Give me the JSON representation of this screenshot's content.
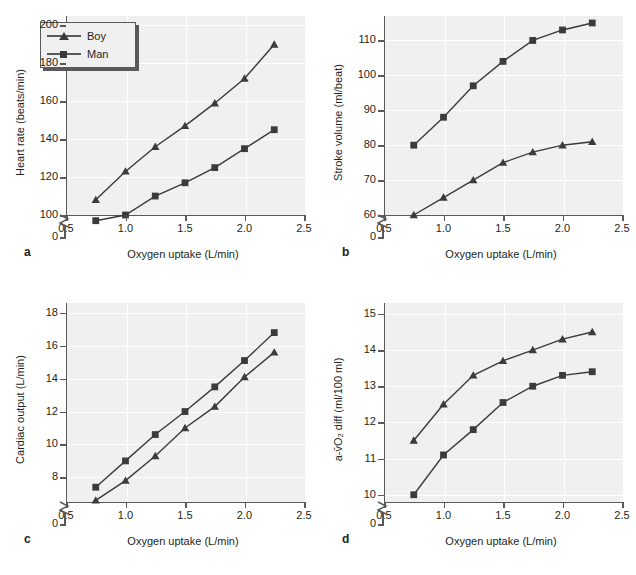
{
  "figure": {
    "legend": {
      "boy_label": "Boy",
      "man_label": "Man"
    },
    "xlabel": "Oxygen uptake (L/min)",
    "xticks": [
      "0.5",
      "1.0",
      "1.5",
      "2.0",
      "2.5"
    ],
    "panel_letters": {
      "a": "a",
      "b": "b",
      "c": "c",
      "d": "d"
    },
    "colors": {
      "plot_background": "#f0f0f0",
      "gridline": "#ffffff",
      "axis": "#58595b",
      "series": "#3b3b3d",
      "text": "#231f20"
    }
  },
  "chart_data": [
    {
      "type": "line",
      "panel": "a",
      "title": "",
      "xlabel": "Oxygen uptake (L/min)",
      "ylabel": "Heart rate (beats/min)",
      "x": [
        0.75,
        1.0,
        1.25,
        1.5,
        1.75,
        2.0,
        2.25
      ],
      "xlim": [
        0.5,
        2.5
      ],
      "xticks": [
        0.5,
        1.0,
        1.5,
        2.0,
        2.5
      ],
      "yticks": [
        0,
        100,
        120,
        140,
        160,
        180,
        200
      ],
      "ytick_labels": [
        "0",
        "100",
        "120",
        "140",
        "160",
        "180",
        "200"
      ],
      "ylim": [
        100,
        205
      ],
      "axis_break": true,
      "grid": true,
      "legend_position": "upper-left",
      "series": [
        {
          "name": "Boy",
          "marker": "triangle",
          "values": [
            108,
            123,
            136,
            147,
            159,
            172,
            190
          ]
        },
        {
          "name": "Man",
          "marker": "square",
          "values": [
            97,
            100,
            110,
            117,
            125,
            135,
            145
          ]
        }
      ]
    },
    {
      "type": "line",
      "panel": "b",
      "title": "",
      "xlabel": "Oxygen uptake (L/min)",
      "ylabel": "Stroke volume (ml/beat)",
      "x": [
        0.75,
        1.0,
        1.25,
        1.5,
        1.75,
        2.0,
        2.25
      ],
      "xlim": [
        0.5,
        2.5
      ],
      "xticks": [
        0.5,
        1.0,
        1.5,
        2.0,
        2.5
      ],
      "yticks": [
        0,
        60,
        70,
        80,
        90,
        100,
        110
      ],
      "ytick_labels": [
        "0",
        "60",
        "70",
        "80",
        "90",
        "100",
        "110"
      ],
      "ylim": [
        60,
        117
      ],
      "axis_break": true,
      "grid": true,
      "legend_position": "none",
      "series": [
        {
          "name": "Boy",
          "marker": "triangle",
          "values": [
            60,
            65,
            70,
            75,
            78,
            80,
            81
          ]
        },
        {
          "name": "Man",
          "marker": "square",
          "values": [
            80,
            88,
            97,
            104,
            110,
            113,
            115
          ]
        }
      ]
    },
    {
      "type": "line",
      "panel": "c",
      "title": "",
      "xlabel": "Oxygen uptake (L/min)",
      "ylabel": "Cardiac output (L/min)",
      "x": [
        0.75,
        1.0,
        1.25,
        1.5,
        1.75,
        2.0,
        2.25
      ],
      "xlim": [
        0.5,
        2.5
      ],
      "xticks": [
        0.5,
        1.0,
        1.5,
        2.0,
        2.5
      ],
      "yticks": [
        0,
        8,
        10,
        12,
        14,
        16,
        18
      ],
      "ytick_labels": [
        "0",
        "8",
        "10",
        "12",
        "14",
        "16",
        "18"
      ],
      "ylim": [
        6.5,
        18.6
      ],
      "axis_break": true,
      "grid": true,
      "legend_position": "none",
      "series": [
        {
          "name": "Boy",
          "marker": "triangle",
          "values": [
            6.6,
            7.8,
            9.3,
            11.0,
            12.3,
            14.1,
            15.6
          ]
        },
        {
          "name": "Man",
          "marker": "square",
          "values": [
            7.4,
            9.0,
            10.6,
            12.0,
            13.5,
            15.1,
            16.8
          ]
        }
      ]
    },
    {
      "type": "line",
      "panel": "d",
      "title": "",
      "xlabel": "Oxygen uptake (L/min)",
      "ylabel": "a-v̄O₂ diff (ml/100 ml)",
      "x": [
        0.75,
        1.0,
        1.25,
        1.5,
        1.75,
        2.0,
        2.25
      ],
      "xlim": [
        0.5,
        2.5
      ],
      "xticks": [
        0.5,
        1.0,
        1.5,
        2.0,
        2.5
      ],
      "yticks": [
        0,
        10,
        11,
        12,
        13,
        14,
        15
      ],
      "ytick_labels": [
        "0",
        "10",
        "11",
        "12",
        "13",
        "14",
        "15"
      ],
      "ylim": [
        9.8,
        15.3
      ],
      "axis_break": true,
      "grid": true,
      "legend_position": "none",
      "series": [
        {
          "name": "Boy",
          "marker": "triangle",
          "values": [
            11.5,
            12.5,
            13.3,
            13.7,
            14.0,
            14.3,
            14.5
          ]
        },
        {
          "name": "Man",
          "marker": "square",
          "values": [
            10.0,
            11.1,
            11.8,
            12.55,
            13.0,
            13.3,
            13.4
          ]
        }
      ]
    }
  ]
}
